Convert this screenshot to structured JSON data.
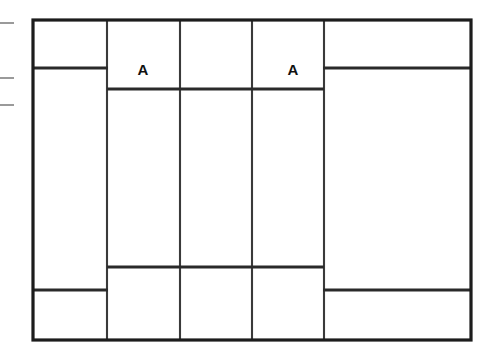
{
  "diagram": {
    "background_color": "#ffffff",
    "line_color": "#1c1c1c",
    "divider_color": "#3a3a3a",
    "tick_color": "#9a9a9a",
    "outer_frame": {
      "name": "outer-frame",
      "x": 33,
      "y": 20,
      "width": 438,
      "height": 320
    },
    "labels": [
      {
        "id": "label-a-left",
        "text": "A",
        "x": 143,
        "y": 71
      },
      {
        "id": "label-a-right",
        "text": "A",
        "x": 293,
        "y": 71
      }
    ],
    "vertical_dividers": [
      {
        "id": "divider-v-1",
        "x": 107,
        "y1": 20,
        "y2": 340
      },
      {
        "id": "divider-v-2",
        "x": 180,
        "y1": 20,
        "y2": 340
      },
      {
        "id": "divider-v-3",
        "x": 252,
        "y1": 20,
        "y2": 340
      },
      {
        "id": "divider-v-4",
        "x": 324,
        "y1": 20,
        "y2": 340
      }
    ],
    "horizontal_rails": [
      {
        "id": "rail-left-upper",
        "x1": 33,
        "x2": 108,
        "y": 68
      },
      {
        "id": "rail-right-upper",
        "x1": 323,
        "x2": 471,
        "y": 68
      },
      {
        "id": "rail-center-upper",
        "x1": 107,
        "x2": 324,
        "y": 89
      },
      {
        "id": "rail-center-lower",
        "x1": 107,
        "x2": 324,
        "y": 267
      },
      {
        "id": "rail-left-lower",
        "x1": 33,
        "x2": 108,
        "y": 290
      },
      {
        "id": "rail-right-lower",
        "x1": 323,
        "x2": 471,
        "y": 290
      }
    ],
    "edge_ticks": [
      {
        "id": "tick-1",
        "x1": 0,
        "x2": 14,
        "y": 23
      },
      {
        "id": "tick-2",
        "x1": 0,
        "x2": 14,
        "y": 78
      },
      {
        "id": "tick-3",
        "x1": 0,
        "x2": 14,
        "y": 105
      }
    ],
    "columns": [
      {
        "id": "column-left",
        "x": 33,
        "width": 74
      },
      {
        "id": "column-center-1",
        "x": 107,
        "width": 73
      },
      {
        "id": "column-center-2",
        "x": 180,
        "width": 72
      },
      {
        "id": "column-center-3",
        "x": 252,
        "width": 72
      },
      {
        "id": "column-right",
        "x": 324,
        "width": 147
      }
    ]
  }
}
